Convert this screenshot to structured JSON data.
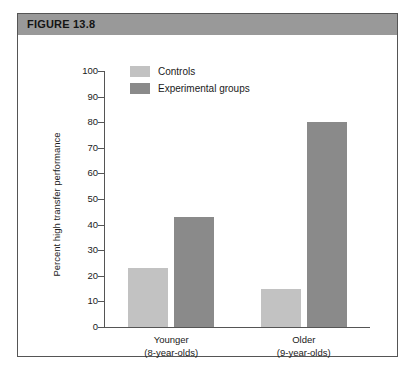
{
  "figure": {
    "header_label": "FIGURE 13.8"
  },
  "colors": {
    "header_bar": "#999999",
    "panel_border": "#555555",
    "controls": "#c2c2c2",
    "experimental": "#8a8a8a",
    "axis": "#555555",
    "text": "#1a1a1a"
  },
  "chart_data": {
    "type": "bar",
    "title": "FIGURE 13.8",
    "xlabel": "",
    "ylabel": "Percent high transfer performance",
    "ylim": [
      0,
      100
    ],
    "ytick_step": 10,
    "yticks": [
      0,
      10,
      20,
      30,
      40,
      50,
      60,
      70,
      80,
      90,
      100
    ],
    "grid": false,
    "legend_position": "top-center",
    "categories": [
      "Younger",
      "Older"
    ],
    "category_sublabels": [
      "(8-year-olds)",
      "(9-year-olds)"
    ],
    "series": [
      {
        "name": "Controls",
        "color": "#c2c2c2",
        "values": [
          23,
          15
        ]
      },
      {
        "name": "Experimental groups",
        "color": "#8a8a8a",
        "values": [
          43,
          80
        ]
      }
    ]
  }
}
